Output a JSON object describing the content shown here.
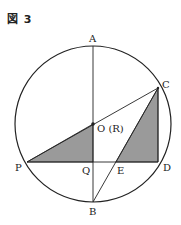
{
  "figure": {
    "title": "図 3",
    "labels": {
      "A": "A",
      "B": "B",
      "C": "C",
      "D": "D",
      "E": "E",
      "P": "P",
      "Q": "Q",
      "O": "O (R)"
    },
    "colors": {
      "stroke": "#222222",
      "shade": "#9a9a9a"
    },
    "shaded_regions": [
      "triangle O-P-Q",
      "triangle C-E-D"
    ]
  }
}
